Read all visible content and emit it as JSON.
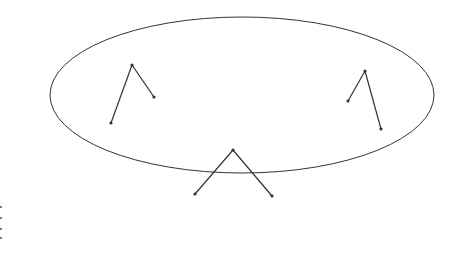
{
  "diagram": {
    "width": 450,
    "height": 280,
    "colors": {
      "stroke": "#333333",
      "background": "#ffffff"
    },
    "ellipse": {
      "cx": 242,
      "cy": 95,
      "rx": 192,
      "ry": 78
    },
    "trees": [
      {
        "name": "left-tree",
        "apex": [
          132,
          65
        ],
        "left": [
          111,
          123
        ],
        "right": [
          154,
          97
        ]
      },
      {
        "name": "right-tree",
        "apex": [
          365,
          71
        ],
        "left": [
          348,
          101
        ],
        "right": [
          381,
          129
        ]
      },
      {
        "name": "bottom-tree",
        "apex": [
          233,
          150
        ],
        "left": [
          195,
          194
        ],
        "right": [
          272,
          196
        ]
      }
    ],
    "edge_marks": [
      [
        1,
        207
      ],
      [
        1,
        218
      ],
      [
        1,
        229
      ],
      [
        1,
        238
      ]
    ]
  }
}
